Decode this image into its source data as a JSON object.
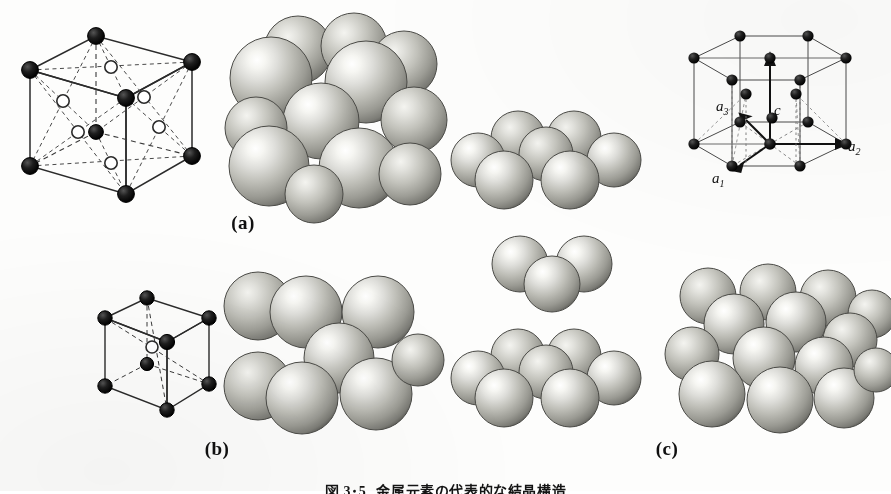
{
  "figure": {
    "caption_number": "図 3･5",
    "caption_text": "金属元素の代表的な結晶構造",
    "background_color": "#fdfdfc",
    "ink_color": "#141414"
  },
  "panels": [
    {
      "id": "a",
      "label": "(a)",
      "structure_name": "face-centred-cubic",
      "unit_cell": {
        "type": "fcc",
        "corner_atoms": 8,
        "face_atoms": 6,
        "corner_style": "filled",
        "face_style": "open"
      },
      "sphere_model": {
        "type": "fcc-hard-sphere",
        "visible_spheres": 13
      }
    },
    {
      "id": "b",
      "label": "(b)",
      "structure_name": "body-centred-cubic",
      "unit_cell": {
        "type": "bcc",
        "corner_atoms": 8,
        "body_atoms": 1,
        "corner_style": "filled",
        "body_style": "open"
      },
      "sphere_model": {
        "type": "bcc-hard-sphere",
        "visible_spheres": 9
      }
    },
    {
      "id": "c",
      "label": "(c)",
      "structure_name": "hexagonal-close-packed",
      "unit_cell": {
        "type": "hcp",
        "axis_labels": [
          "c",
          "a₁",
          "a₂",
          "a₃"
        ],
        "corner_atoms": 12,
        "mid_plane_atoms": 3,
        "basal_centre_atoms": 2
      },
      "sphere_model": {
        "type": "hcp-hard-sphere",
        "visible_spheres": 14
      }
    }
  ],
  "stacking_column": {
    "name": "close-packed-layer-stacking",
    "layers": [
      {
        "id": "top",
        "label": "A",
        "spheres": 7
      },
      {
        "id": "middle",
        "label": "B",
        "spheres": 3
      },
      {
        "id": "bottom",
        "label": "A",
        "spheres": 7
      }
    ]
  },
  "axes": {
    "c": "c",
    "a1": "a",
    "a1_sub": "1",
    "a2": "a",
    "a2_sub": "2",
    "a3": "a",
    "a3_sub": "3"
  },
  "colors": {
    "sphere_light": "#f2f2ee",
    "sphere_mid": "#b9b9b2",
    "sphere_dark": "#6e6e68",
    "sphere_rim": "#4a4a46",
    "atom_fill": "#1b1b1b",
    "line": "#2b2b2b"
  }
}
